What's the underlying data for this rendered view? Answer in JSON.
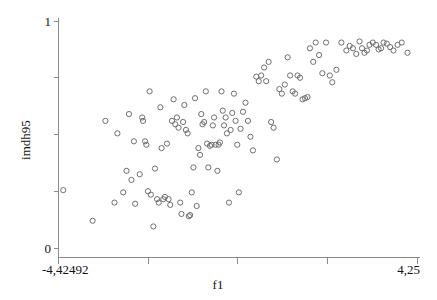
{
  "chart_data": {
    "type": "scatter",
    "title": "",
    "xlabel": "f1",
    "ylabel": "imdh95",
    "xlim": [
      -4.42492,
      4.25
    ],
    "ylim": [
      0,
      1
    ],
    "grid": false,
    "legend": null,
    "x_tick_labels": [
      "-4,42492",
      "4,25"
    ],
    "y_tick_labels": [
      "1",
      "0"
    ],
    "x_tick_values": [
      -4.42492,
      4.25
    ],
    "y_tick_values": [
      1,
      0
    ],
    "x_minor_tick_count": 3,
    "y_minor_tick_count": 3,
    "marker": "open-circle",
    "marker_color": "#6e6e6e",
    "n_points": 131,
    "points": [
      [
        -4.31,
        0.255
      ],
      [
        -3.6,
        0.12
      ],
      [
        -3.29,
        0.56
      ],
      [
        -3.07,
        0.2
      ],
      [
        -3.0,
        0.505
      ],
      [
        -2.86,
        0.245
      ],
      [
        -2.78,
        0.34
      ],
      [
        -2.72,
        0.59
      ],
      [
        -2.66,
        0.3
      ],
      [
        -2.6,
        0.47
      ],
      [
        -2.57,
        0.195
      ],
      [
        -2.46,
        0.325
      ],
      [
        -2.4,
        0.575
      ],
      [
        -2.38,
        0.56
      ],
      [
        -2.33,
        0.47
      ],
      [
        -2.3,
        0.455
      ],
      [
        -2.26,
        0.25
      ],
      [
        -2.22,
        0.69
      ],
      [
        -2.19,
        0.235
      ],
      [
        -2.13,
        0.095
      ],
      [
        -2.09,
        0.35
      ],
      [
        -2.04,
        0.215
      ],
      [
        -2.0,
        0.2
      ],
      [
        -1.96,
        0.62
      ],
      [
        -1.93,
        0.44
      ],
      [
        -1.89,
        0.215
      ],
      [
        -1.85,
        0.225
      ],
      [
        -1.8,
        0.46
      ],
      [
        -1.76,
        0.215
      ],
      [
        -1.72,
        0.19
      ],
      [
        -1.68,
        0.56
      ],
      [
        -1.64,
        0.655
      ],
      [
        -1.6,
        0.545
      ],
      [
        -1.56,
        0.575
      ],
      [
        -1.52,
        0.53
      ],
      [
        -1.48,
        0.2
      ],
      [
        -1.45,
        0.15
      ],
      [
        -1.41,
        0.555
      ],
      [
        -1.38,
        0.63
      ],
      [
        -1.34,
        0.52
      ],
      [
        -1.3,
        0.505
      ],
      [
        -1.27,
        0.14
      ],
      [
        -1.24,
        0.145
      ],
      [
        -1.2,
        0.245
      ],
      [
        -1.16,
        0.355
      ],
      [
        -1.12,
        0.66
      ],
      [
        -1.08,
        0.185
      ],
      [
        -1.04,
        0.44
      ],
      [
        -1.0,
        0.41
      ],
      [
        -0.97,
        0.59
      ],
      [
        -0.94,
        0.545
      ],
      [
        -0.9,
        0.555
      ],
      [
        -0.86,
        0.69
      ],
      [
        -0.83,
        0.46
      ],
      [
        -0.8,
        0.355
      ],
      [
        -0.76,
        0.45
      ],
      [
        -0.72,
        0.455
      ],
      [
        -0.69,
        0.54
      ],
      [
        -0.66,
        0.575
      ],
      [
        -0.62,
        0.455
      ],
      [
        -0.58,
        0.34
      ],
      [
        -0.55,
        0.455
      ],
      [
        -0.52,
        0.465
      ],
      [
        -0.48,
        0.69
      ],
      [
        -0.45,
        0.605
      ],
      [
        -0.42,
        0.54
      ],
      [
        -0.38,
        0.575
      ],
      [
        -0.35,
        0.505
      ],
      [
        -0.3,
        0.2
      ],
      [
        -0.26,
        0.52
      ],
      [
        -0.22,
        0.595
      ],
      [
        -0.18,
        0.68
      ],
      [
        -0.14,
        0.56
      ],
      [
        -0.1,
        0.455
      ],
      [
        -0.06,
        0.245
      ],
      [
        -0.02,
        0.525
      ],
      [
        0.04,
        0.6
      ],
      [
        0.1,
        0.64
      ],
      [
        0.16,
        0.56
      ],
      [
        0.22,
        0.49
      ],
      [
        0.28,
        0.43
      ],
      [
        0.36,
        0.755
      ],
      [
        0.42,
        0.735
      ],
      [
        0.48,
        0.76
      ],
      [
        0.55,
        0.795
      ],
      [
        0.6,
        0.735
      ],
      [
        0.66,
        0.82
      ],
      [
        0.72,
        0.555
      ],
      [
        0.78,
        0.53
      ],
      [
        0.86,
        0.39
      ],
      [
        0.92,
        0.7
      ],
      [
        0.98,
        0.68
      ],
      [
        1.05,
        0.72
      ],
      [
        1.12,
        0.84
      ],
      [
        1.18,
        0.76
      ],
      [
        1.24,
        0.69
      ],
      [
        1.3,
        0.68
      ],
      [
        1.36,
        0.76
      ],
      [
        1.42,
        0.75
      ],
      [
        1.48,
        0.655
      ],
      [
        1.54,
        0.66
      ],
      [
        1.6,
        0.665
      ],
      [
        1.66,
        0.88
      ],
      [
        1.74,
        0.82
      ],
      [
        1.8,
        0.905
      ],
      [
        1.88,
        0.85
      ],
      [
        1.96,
        0.77
      ],
      [
        2.05,
        0.905
      ],
      [
        2.14,
        0.76
      ],
      [
        2.2,
        0.73
      ],
      [
        2.3,
        0.785
      ],
      [
        2.42,
        0.905
      ],
      [
        2.54,
        0.87
      ],
      [
        2.62,
        0.89
      ],
      [
        2.7,
        0.88
      ],
      [
        2.78,
        0.855
      ],
      [
        2.86,
        0.91
      ],
      [
        2.92,
        0.88
      ],
      [
        2.98,
        0.86
      ],
      [
        3.04,
        0.87
      ],
      [
        3.1,
        0.895
      ],
      [
        3.18,
        0.905
      ],
      [
        3.26,
        0.895
      ],
      [
        3.32,
        0.875
      ],
      [
        3.38,
        0.88
      ],
      [
        3.44,
        0.905
      ],
      [
        3.52,
        0.9
      ],
      [
        3.6,
        0.885
      ],
      [
        3.68,
        0.87
      ],
      [
        3.78,
        0.895
      ],
      [
        3.88,
        0.905
      ],
      [
        4.02,
        0.86
      ]
    ]
  },
  "axes": {
    "x_label": "f1",
    "y_label": "imdh95",
    "x_min_label": "-4,42492",
    "x_max_label": "4,25",
    "y_min_label": "0",
    "y_max_label": "1"
  }
}
